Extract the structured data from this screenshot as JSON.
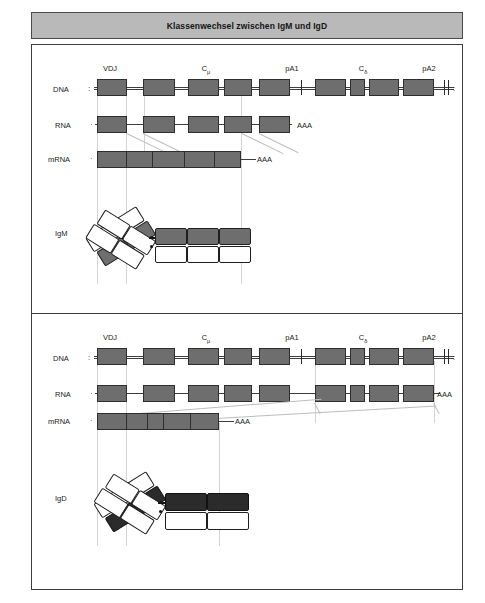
{
  "figure": {
    "title": "Klassenwechsel zwischen IgM und IgD",
    "column_headers": [
      "VDJ",
      "C",
      "pA1",
      "C",
      "pA2"
    ],
    "column_header_full": [
      "VDJ",
      "Cμ",
      "pA1",
      "Cδ",
      "pA2"
    ],
    "c_mu_sub": "μ",
    "c_delta_sub": "δ",
    "poly_a_label": "AAA",
    "dna_end_left": ":",
    "dna_end_right": ":",
    "rna_end_left": "·",
    "mrna_end_left": "·"
  },
  "panel_top": {
    "row_labels": {
      "dna": "DNA",
      "rna": "RNA",
      "mrna": "mRNA",
      "product": "IgM"
    },
    "dna_poly_a_1": "pA1",
    "dna_poly_a_2": "pA2",
    "rna_tail": "AAA",
    "mrna_tail": "AAA",
    "dna_exon_count": 9,
    "rna_exon_count": 5,
    "mrna_segment_count": 5,
    "antibody": {
      "name": "IgM",
      "heavy_constant_domains": 3,
      "heavy_constant_shade": "grey",
      "light_constant_domains": 3,
      "fab_arms": 2
    }
  },
  "panel_bottom": {
    "row_labels": {
      "dna": "DNA",
      "rna": "RNA",
      "mrna": "mRNA",
      "product": "IgD"
    },
    "dna_poly_a_1": "pA1",
    "dna_poly_a_2": "pA2",
    "rna_tail": "AAA",
    "mrna_tail": "AAA",
    "dna_exon_count": 9,
    "rna_exon_count": 9,
    "mrna_segment_count": 5,
    "antibody": {
      "name": "IgD",
      "heavy_constant_domains": 2,
      "heavy_constant_shade": "black",
      "light_constant_domains": 2,
      "fab_arms": 2
    }
  },
  "colors": {
    "title_bar_bg": "#b9b9b9",
    "exon_fill": "#6e6e6e",
    "igd_constant_fill": "#2b2b2b",
    "frame_stroke": "#3d3d3d",
    "splice_line": "#bdbdbd",
    "guide_line": "#d4d4d4",
    "page_bg": "#ffffff"
  }
}
